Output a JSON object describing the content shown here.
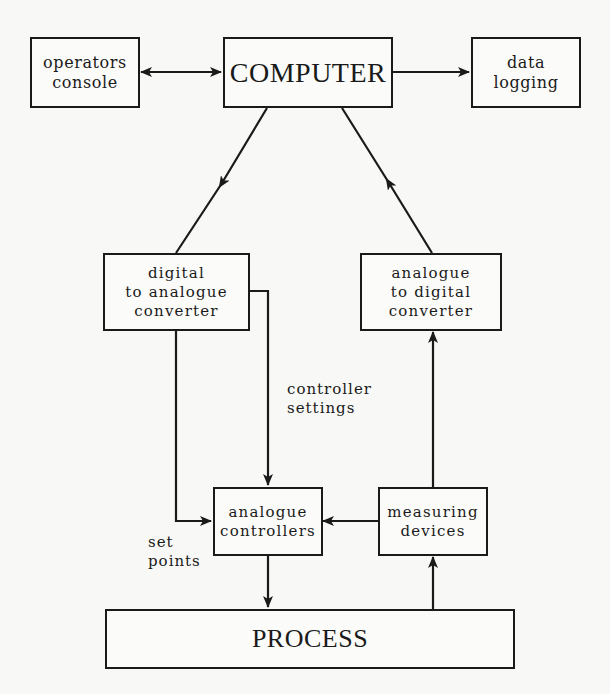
{
  "diagram": {
    "type": "process-control block diagram",
    "nodes": [
      {
        "id": "operators_console",
        "label": "operators\nconsole"
      },
      {
        "id": "computer",
        "label": "COMPUTER"
      },
      {
        "id": "data_logging",
        "label": "data\nlogging"
      },
      {
        "id": "dac",
        "label": "digital\nto analogue\nconverter"
      },
      {
        "id": "adc",
        "label": "analogue\nto digital\nconverter"
      },
      {
        "id": "analogue_controllers",
        "label": "analogue\ncontrollers"
      },
      {
        "id": "measuring_devices",
        "label": "measuring\ndevices"
      },
      {
        "id": "process",
        "label": "PROCESS"
      }
    ],
    "edges": [
      {
        "from": "operators_console",
        "to": "computer",
        "bidirectional": true
      },
      {
        "from": "computer",
        "to": "data_logging"
      },
      {
        "from": "computer",
        "to": "dac"
      },
      {
        "from": "adc",
        "to": "computer"
      },
      {
        "from": "dac",
        "to": "analogue_controllers",
        "label": "controller\nsettings"
      },
      {
        "from": "dac",
        "to": "analogue_controllers",
        "label": "set\npoints"
      },
      {
        "from": "measuring_devices",
        "to": "analogue_controllers"
      },
      {
        "from": "measuring_devices",
        "to": "adc"
      },
      {
        "from": "analogue_controllers",
        "to": "process"
      },
      {
        "from": "process",
        "to": "measuring_devices"
      }
    ]
  },
  "labels": {
    "operators_console": "operators\nconsole",
    "computer": "COMPUTER",
    "data_logging": "data\nlogging",
    "dac": "digital\nto analogue\nconverter",
    "adc": "analogue\nto digital\nconverter",
    "analogue_controllers": "analogue\ncontrollers",
    "measuring_devices": "measuring\ndevices",
    "process": "PROCESS",
    "controller_settings": "controller\nsettings",
    "set_points": "set\npoints"
  },
  "colors": {
    "ink": "#1a1a1a",
    "paper": "#f8f8f6"
  }
}
